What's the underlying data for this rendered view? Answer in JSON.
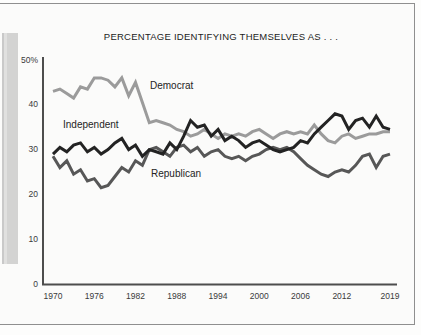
{
  "figure": {
    "title": "PERCENTAGE IDENTIFYING THEMSELVES AS . . .",
    "frame_color": "#8f8f8f",
    "background": "#fbfbfa",
    "axis_color": "#4d4d4d",
    "text_color": "#2a2a2a"
  },
  "chart_data": {
    "type": "line",
    "title": "PERCENTAGE IDENTIFYING THEMSELVES AS . . .",
    "xlabel": "",
    "ylabel": "",
    "xlim": [
      1970,
      2019
    ],
    "ylim": [
      0,
      50
    ],
    "grid": false,
    "legend_position": "inline-annotations",
    "xticks": [
      1970,
      1976,
      1982,
      1988,
      1994,
      2000,
      2006,
      2012,
      2019
    ],
    "yticks": [
      {
        "value": 0,
        "label": "0"
      },
      {
        "value": 10,
        "label": "10"
      },
      {
        "value": 20,
        "label": "20"
      },
      {
        "value": 30,
        "label": "30"
      },
      {
        "value": 40,
        "label": "40"
      },
      {
        "value": 50,
        "label": "50%"
      }
    ],
    "x": [
      1970,
      1971,
      1972,
      1973,
      1974,
      1975,
      1976,
      1977,
      1978,
      1979,
      1980,
      1981,
      1982,
      1983,
      1984,
      1985,
      1986,
      1987,
      1988,
      1989,
      1990,
      1991,
      1992,
      1993,
      1994,
      1995,
      1996,
      1997,
      1998,
      1999,
      2000,
      2001,
      2002,
      2003,
      2004,
      2005,
      2006,
      2007,
      2008,
      2009,
      2010,
      2011,
      2012,
      2013,
      2014,
      2015,
      2016,
      2017,
      2018,
      2019
    ],
    "series": [
      {
        "name": "Democrat",
        "color": "#9b9b9b",
        "values": [
          43,
          43.5,
          42.5,
          41.5,
          44,
          43.5,
          46,
          46,
          45.5,
          44,
          46,
          42,
          45,
          40.5,
          36,
          36.5,
          36,
          35.5,
          34.5,
          34,
          33,
          33.5,
          34.5,
          33.5,
          32.5,
          33.5,
          33,
          33.5,
          33,
          34,
          34.5,
          33.5,
          32.5,
          33.5,
          34,
          33.5,
          34,
          33.5,
          35.5,
          33.5,
          32,
          31.5,
          33,
          33.5,
          32.5,
          33,
          33.5,
          33.5,
          34,
          34
        ]
      },
      {
        "name": "Independent",
        "color": "#232323",
        "values": [
          29,
          30.5,
          29.5,
          31,
          31.5,
          29.5,
          30.5,
          29,
          30,
          31.5,
          32.5,
          30,
          31,
          28.5,
          30,
          29.5,
          29,
          31.5,
          30,
          33,
          36.5,
          35,
          35.5,
          33,
          34.5,
          32,
          33,
          32,
          30.5,
          31.5,
          32,
          31,
          30,
          29.5,
          30,
          30.5,
          32,
          31.5,
          33.5,
          35,
          36.5,
          38,
          37.5,
          34.5,
          36.5,
          37,
          35,
          37.5,
          35,
          34.5
        ]
      },
      {
        "name": "Republican",
        "color": "#575757",
        "values": [
          28.5,
          26,
          27.5,
          24.5,
          25.5,
          23,
          23.5,
          21.5,
          22,
          24,
          26,
          25,
          27.5,
          26.5,
          30,
          30.5,
          29.5,
          28.5,
          30.5,
          31,
          29.5,
          30.5,
          28.5,
          29.5,
          30,
          28.5,
          28,
          28.5,
          27.5,
          28.5,
          29,
          30,
          30.5,
          30,
          30.5,
          29.5,
          28,
          26.5,
          25.5,
          24.5,
          24,
          25,
          25.5,
          25,
          26.5,
          28.5,
          29,
          26,
          28.5,
          29
        ]
      }
    ]
  }
}
